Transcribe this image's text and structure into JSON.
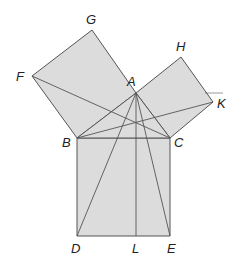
{
  "colors": {
    "fill": "#dcdcdc",
    "stroke": "#555555",
    "label": "#222222"
  },
  "points": {
    "A": [
      136,
      93
    ],
    "B": [
      77,
      138
    ],
    "C": [
      170,
      138
    ],
    "D": [
      77,
      236
    ],
    "E": [
      170,
      236
    ],
    "L": [
      136,
      236
    ],
    "F": [
      32,
      76
    ],
    "G": [
      92,
      30
    ],
    "H": [
      181,
      57
    ],
    "K": [
      213,
      102
    ]
  },
  "polygons": [
    {
      "name": "square-BAGF",
      "points": "77,138 136,93 92,30 32,76"
    },
    {
      "name": "square-ACKH",
      "points": "136,93 170,138 213,102 181,57"
    },
    {
      "name": "square-BCED",
      "points": "77,138 170,138 170,236 77,236"
    },
    {
      "name": "triangle-ABC",
      "points": "77,138 170,138 136,93"
    }
  ],
  "segments": [
    {
      "name": "line-FC",
      "from": [
        32,
        76
      ],
      "to": [
        170,
        138
      ]
    },
    {
      "name": "line-BK",
      "from": [
        77,
        138
      ],
      "to": [
        213,
        102
      ]
    },
    {
      "name": "line-AD",
      "from": [
        136,
        93
      ],
      "to": [
        77,
        236
      ]
    },
    {
      "name": "line-AE",
      "from": [
        136,
        93
      ],
      "to": [
        170,
        236
      ]
    },
    {
      "name": "line-AL",
      "from": [
        136,
        93
      ],
      "to": [
        136,
        236
      ]
    },
    {
      "name": "line-K-tick",
      "from": [
        205,
        93
      ],
      "to": [
        223,
        93
      ]
    }
  ],
  "labels": [
    {
      "text": "G",
      "x": 86,
      "y": 24
    },
    {
      "text": "F",
      "x": 16,
      "y": 81
    },
    {
      "text": "A",
      "x": 127,
      "y": 86
    },
    {
      "text": "H",
      "x": 176,
      "y": 51
    },
    {
      "text": "K",
      "x": 217,
      "y": 108
    },
    {
      "text": "B",
      "x": 62,
      "y": 147
    },
    {
      "text": "C",
      "x": 174,
      "y": 147
    },
    {
      "text": "D",
      "x": 71,
      "y": 253
    },
    {
      "text": "L",
      "x": 132,
      "y": 253
    },
    {
      "text": "E",
      "x": 167,
      "y": 253
    }
  ]
}
